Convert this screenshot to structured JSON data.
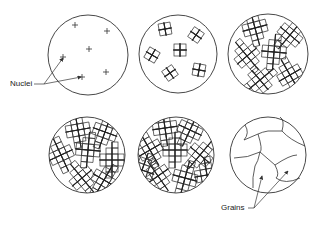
{
  "diagram": {
    "stages": [
      {
        "id": 1,
        "description": "Nuclei formation"
      },
      {
        "id": 2,
        "description": "Crystal growth from nuclei"
      },
      {
        "id": 3,
        "description": "Continued dendritic growth"
      },
      {
        "id": 4,
        "description": "Crystals impinging"
      },
      {
        "id": 5,
        "description": "Nearly complete solidification"
      },
      {
        "id": 6,
        "description": "Final grain structure"
      }
    ],
    "labels": {
      "nuclei": "Nuclei",
      "grains": "Grains"
    },
    "colors": {
      "line": "#333333",
      "background": "#ffffff"
    }
  }
}
